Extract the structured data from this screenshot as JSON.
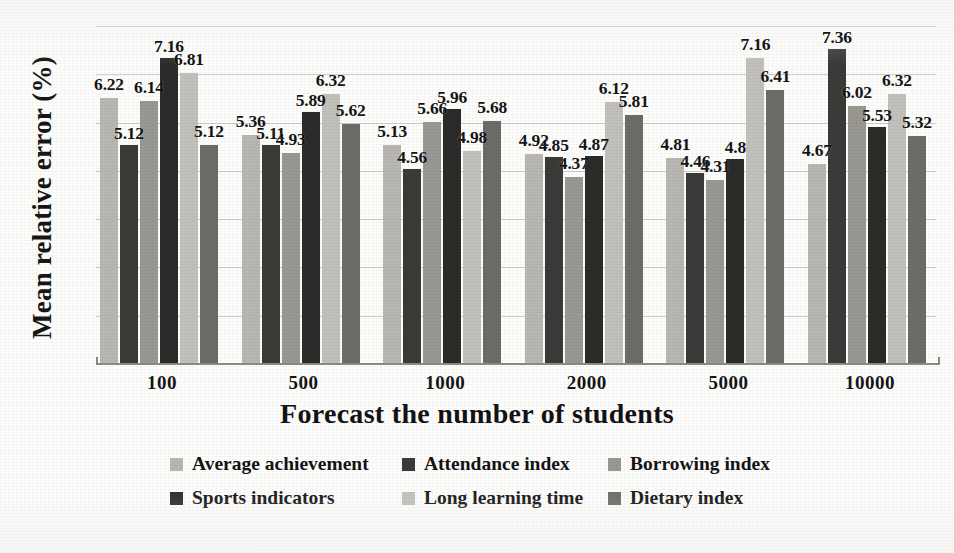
{
  "chart_data": {
    "type": "bar",
    "title": "",
    "xlabel": "Forecast the number of students",
    "ylabel": "Mean relative error (%)",
    "categories": [
      "100",
      "500",
      "1000",
      "2000",
      "5000",
      "10000"
    ],
    "ylim": [
      0,
      7.9
    ],
    "grid": true,
    "gridlines": 7,
    "axis_tick_labels": [],
    "legend_position": "bottom",
    "series": [
      {
        "name": "Average achievement",
        "color": "#b9b7b2",
        "values": [
          6.22,
          5.36,
          5.13,
          4.92,
          4.81,
          4.67
        ]
      },
      {
        "name": "Attendance index",
        "color": "#3a3a38",
        "values": [
          5.12,
          5.11,
          4.56,
          4.85,
          4.46,
          7.36
        ]
      },
      {
        "name": "Borrowing index",
        "color": "#9a9893",
        "values": [
          6.14,
          4.93,
          5.66,
          4.37,
          4.31,
          6.02
        ]
      },
      {
        "name": "Sports indicators",
        "color": "#2b2b29",
        "values": [
          7.16,
          5.89,
          5.96,
          4.87,
          4.8,
          5.53
        ]
      },
      {
        "name": "Long learning time",
        "color": "#c2c0bb",
        "values": [
          6.81,
          6.32,
          4.98,
          6.12,
          7.16,
          6.32
        ]
      },
      {
        "name": "Dietary index",
        "color": "#6e6c68",
        "values": [
          5.12,
          5.62,
          5.68,
          5.81,
          6.41,
          5.32
        ]
      }
    ],
    "data_labels": [
      [
        "6.22",
        "5.12",
        "6.14",
        "7.16",
        "6.81",
        "5.12"
      ],
      [
        "5.36",
        "5.11",
        "4.93",
        "5.89",
        "6.32",
        "5.62"
      ],
      [
        "5.13",
        "4.56",
        "5.66",
        "5.96",
        "4.98",
        "5.68"
      ],
      [
        "4.92",
        "4.85",
        "4.37",
        "4.87",
        "6.12",
        "5.81"
      ],
      [
        "4.81",
        "4.46",
        "4.31",
        "4.8",
        "7.16",
        "6.41"
      ],
      [
        "4.67",
        "7.36",
        "6.02",
        "5.53",
        "6.32",
        "5.32"
      ]
    ]
  }
}
